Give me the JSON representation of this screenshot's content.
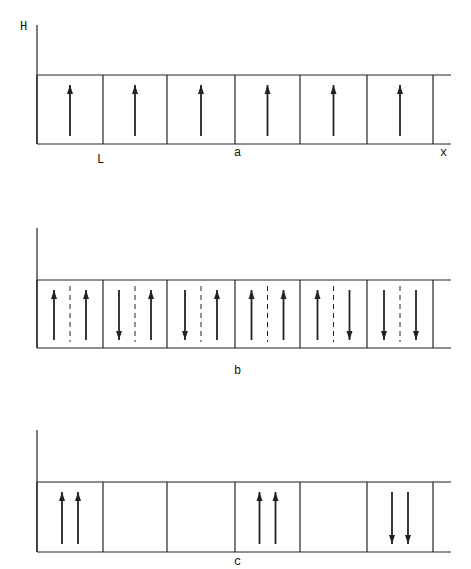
{
  "panels": [
    {
      "id": "a",
      "caption": "a",
      "y_axis_label": "H",
      "x_axis_label": "x",
      "cell_width_label": "L",
      "axis_top": 25,
      "box_top": 75,
      "box_bottom": 144,
      "cells": [
        {
          "arrows": [
            "up"
          ],
          "dashed_divider": false
        },
        {
          "arrows": [
            "up"
          ],
          "dashed_divider": false
        },
        {
          "arrows": [
            "up"
          ],
          "dashed_divider": false
        },
        {
          "arrows": [
            "up"
          ],
          "dashed_divider": false
        },
        {
          "arrows": [
            "up"
          ],
          "dashed_divider": false
        },
        {
          "arrows": [
            "up"
          ],
          "dashed_divider": false
        }
      ]
    },
    {
      "id": "b",
      "caption": "b",
      "axis_top": 228,
      "box_top": 280,
      "box_bottom": 348,
      "cells": [
        {
          "arrows": [
            "up",
            "up"
          ],
          "dashed_divider": true
        },
        {
          "arrows": [
            "down",
            "up"
          ],
          "dashed_divider": true
        },
        {
          "arrows": [
            "down",
            "up"
          ],
          "dashed_divider": true
        },
        {
          "arrows": [
            "up",
            "up"
          ],
          "dashed_divider": true
        },
        {
          "arrows": [
            "up",
            "down"
          ],
          "dashed_divider": true
        },
        {
          "arrows": [
            "down",
            "down"
          ],
          "dashed_divider": true
        }
      ]
    },
    {
      "id": "c",
      "caption": "c",
      "axis_top": 430,
      "box_top": 482,
      "box_bottom": 552,
      "cells": [
        {
          "arrows": [
            "up",
            "up"
          ],
          "dashed_divider": false
        },
        {
          "arrows": [],
          "dashed_divider": false
        },
        {
          "arrows": [],
          "dashed_divider": false
        },
        {
          "arrows": [
            "up",
            "up"
          ],
          "dashed_divider": false
        },
        {
          "arrows": [],
          "dashed_divider": false
        },
        {
          "arrows": [
            "down",
            "down"
          ],
          "dashed_divider": false
        }
      ]
    }
  ],
  "grid": {
    "dividers_x": [
      37,
      103,
      167,
      235,
      300,
      367,
      433
    ],
    "axis_x": 37,
    "line_right": 451
  }
}
